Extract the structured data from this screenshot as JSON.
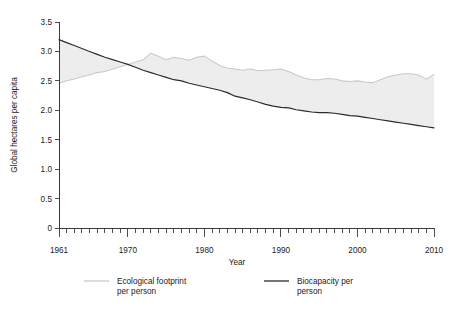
{
  "chart_data": {
    "type": "area",
    "title": "",
    "xlabel": "Year",
    "ylabel": "Global hectares per capita",
    "xlim": [
      1961,
      2010
    ],
    "ylim": [
      0,
      3.5
    ],
    "ytick_labels": [
      "0",
      "0.5",
      "1.0",
      "1.5",
      "2.0",
      "2.5",
      "3.0",
      "3.5"
    ],
    "ytick_values": [
      0,
      0.5,
      1.0,
      1.5,
      2.0,
      2.5,
      3.0,
      3.5
    ],
    "xtick_labels": [
      "1961",
      "1970",
      "1980",
      "1990",
      "2000",
      "2010"
    ],
    "xtick_values": [
      1961,
      1970,
      1980,
      1990,
      2000,
      2010
    ],
    "minor_xticks": "annual",
    "grid": false,
    "legend_position": "below-axis",
    "x": [
      1961,
      1962,
      1963,
      1964,
      1965,
      1966,
      1967,
      1968,
      1969,
      1970,
      1971,
      1972,
      1973,
      1974,
      1975,
      1976,
      1977,
      1978,
      1979,
      1980,
      1981,
      1982,
      1983,
      1984,
      1985,
      1986,
      1987,
      1988,
      1989,
      1990,
      1991,
      1992,
      1993,
      1994,
      1995,
      1996,
      1997,
      1998,
      1999,
      2000,
      2001,
      2002,
      2003,
      2004,
      2005,
      2006,
      2007,
      2008,
      2009,
      2010
    ],
    "series": [
      {
        "name": "Ecological footprint per person",
        "color": "#c9c9c9",
        "values": [
          2.46,
          2.5,
          2.53,
          2.57,
          2.6,
          2.64,
          2.66,
          2.7,
          2.74,
          2.78,
          2.82,
          2.86,
          2.97,
          2.92,
          2.86,
          2.9,
          2.88,
          2.85,
          2.9,
          2.92,
          2.84,
          2.76,
          2.72,
          2.7,
          2.68,
          2.7,
          2.67,
          2.68,
          2.69,
          2.7,
          2.66,
          2.6,
          2.55,
          2.52,
          2.52,
          2.54,
          2.53,
          2.5,
          2.49,
          2.5,
          2.48,
          2.47,
          2.52,
          2.57,
          2.6,
          2.62,
          2.62,
          2.6,
          2.53,
          2.61
        ]
      },
      {
        "name": "Biocapacity per person",
        "color": "#2b2b2b",
        "values": [
          3.2,
          3.15,
          3.1,
          3.05,
          3.0,
          2.95,
          2.9,
          2.86,
          2.82,
          2.78,
          2.73,
          2.68,
          2.64,
          2.6,
          2.56,
          2.52,
          2.5,
          2.46,
          2.43,
          2.4,
          2.37,
          2.34,
          2.3,
          2.24,
          2.21,
          2.18,
          2.14,
          2.1,
          2.07,
          2.05,
          2.04,
          2.01,
          1.99,
          1.97,
          1.96,
          1.96,
          1.95,
          1.93,
          1.91,
          1.9,
          1.88,
          1.86,
          1.84,
          1.82,
          1.8,
          1.78,
          1.76,
          1.74,
          1.72,
          1.7
        ]
      }
    ]
  },
  "legend": {
    "items": [
      {
        "label_line1": "Ecological footprint",
        "label_line2": "per person",
        "swatch": "line-swatch-light"
      },
      {
        "label_line1": "Biocapacity per",
        "label_line2": "person",
        "swatch": "line-swatch-dark"
      }
    ]
  },
  "axes": {
    "y_title": "Global hectares per capita",
    "x_title": "Year"
  },
  "colors": {
    "footprint_line": "#c9c9c9",
    "biocapacity_line": "#2b2b2b",
    "overshoot_fill": "#ededed",
    "axis": "#3a3a3a",
    "text": "#1a1a1a",
    "background": "#ffffff"
  }
}
